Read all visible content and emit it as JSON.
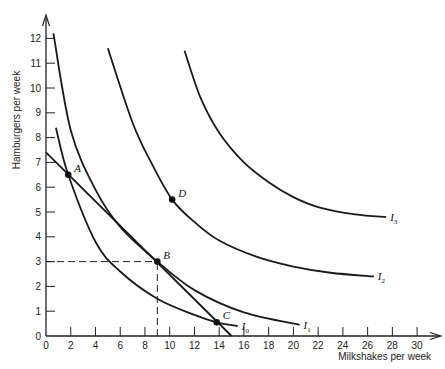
{
  "chart_data": {
    "type": "line",
    "title": "",
    "xlabel": "Milkshakes per week",
    "ylabel": "Hamburgers per week",
    "xlim": [
      0,
      30
    ],
    "ylim": [
      0,
      12
    ],
    "x_ticks": [
      0,
      2,
      4,
      6,
      8,
      10,
      12,
      14,
      16,
      18,
      20,
      22,
      24,
      26,
      28,
      30
    ],
    "y_ticks": [
      0,
      1,
      2,
      3,
      4,
      5,
      6,
      7,
      8,
      9,
      10,
      11,
      12
    ],
    "grid": false,
    "legend": "none (curves labeled inline)",
    "series": [
      {
        "name": "I0",
        "label_main": "I",
        "label_sub": "0",
        "kind": "indifference curve",
        "points": [
          [
            0.8,
            8.4
          ],
          [
            1.8,
            6.5
          ],
          [
            4,
            3.8
          ],
          [
            6,
            2.6
          ],
          [
            9,
            1.5
          ],
          [
            12,
            0.85
          ],
          [
            13.8,
            0.55
          ],
          [
            15.5,
            0.4
          ]
        ]
      },
      {
        "name": "I1",
        "label_main": "I",
        "label_sub": "1",
        "kind": "indifference curve",
        "points": [
          [
            0.6,
            12.2
          ],
          [
            2,
            8.3
          ],
          [
            4,
            5.9
          ],
          [
            6,
            4.4
          ],
          [
            9,
            3.0
          ],
          [
            12,
            1.85
          ],
          [
            16,
            0.95
          ],
          [
            20.5,
            0.45
          ]
        ]
      },
      {
        "name": "I2",
        "label_main": "I",
        "label_sub": "2",
        "kind": "indifference curve",
        "points": [
          [
            5,
            11.6
          ],
          [
            7,
            8.6
          ],
          [
            8.5,
            7.0
          ],
          [
            10.2,
            5.5
          ],
          [
            12,
            4.6
          ],
          [
            14,
            3.85
          ],
          [
            17,
            3.2
          ],
          [
            20,
            2.8
          ],
          [
            23,
            2.55
          ],
          [
            26.5,
            2.4
          ]
        ]
      },
      {
        "name": "I3",
        "label_main": "I",
        "label_sub": "3",
        "kind": "indifference curve",
        "points": [
          [
            11.2,
            11.5
          ],
          [
            12.5,
            9.6
          ],
          [
            14,
            8.2
          ],
          [
            16,
            7.0
          ],
          [
            18,
            6.2
          ],
          [
            20,
            5.6
          ],
          [
            22,
            5.2
          ],
          [
            25,
            4.9
          ],
          [
            27.5,
            4.8
          ]
        ]
      },
      {
        "name": "Budget line",
        "kind": "budget constraint",
        "points": [
          [
            0,
            7.4
          ],
          [
            15,
            0
          ]
        ]
      }
    ],
    "annotations": [
      {
        "label": "A",
        "x": 1.8,
        "y": 6.5
      },
      {
        "label": "B",
        "x": 9,
        "y": 3
      },
      {
        "label": "C",
        "x": 13.8,
        "y": 0.55
      },
      {
        "label": "D",
        "x": 10.2,
        "y": 5.5
      }
    ],
    "reference_lines": [
      {
        "type": "dashed",
        "from": [
          0,
          3
        ],
        "to": [
          9,
          3
        ]
      },
      {
        "type": "dashed",
        "from": [
          9,
          0
        ],
        "to": [
          9,
          3
        ]
      }
    ]
  }
}
